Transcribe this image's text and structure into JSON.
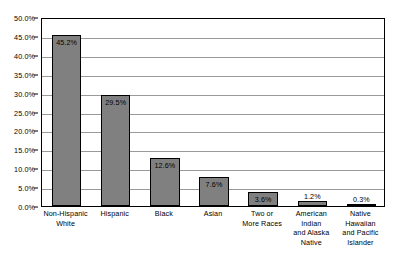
{
  "chart_data": {
    "type": "bar",
    "title": "",
    "subtitle": "",
    "xlabel": "",
    "ylabel": "",
    "ylim": [
      0,
      50
    ],
    "grid": true,
    "legend": "none",
    "orientation": "vertical",
    "categories": [
      "Non-Hispanic White",
      "Hispanic",
      "Black",
      "Asian",
      "Two or More Races",
      "American Indian and Alaska Native",
      "Native Hawaiian and Pacific Islander"
    ],
    "category_lines": [
      [
        "Non-Hispanic",
        "White"
      ],
      [
        "Hispanic"
      ],
      [
        "Black"
      ],
      [
        "Asian"
      ],
      [
        "Two or",
        "More Races"
      ],
      [
        "American",
        "Indian",
        "and Alaska",
        "Native"
      ],
      [
        "Native",
        "Hawaiian",
        "and Pacific",
        "Islander"
      ]
    ],
    "values": [
      45.2,
      29.5,
      12.6,
      7.6,
      3.6,
      1.2,
      0.3
    ],
    "data_labels": [
      "45.2%",
      "29.5%",
      "12.6%",
      "7.6%",
      "3.6%",
      "1.2%",
      "0.3%"
    ],
    "label_placement": [
      "inside",
      "inside",
      "inside",
      "inside",
      "inside",
      "outside",
      "outside"
    ],
    "y_ticks": [
      0,
      5,
      10,
      15,
      20,
      25,
      30,
      35,
      40,
      45,
      50
    ],
    "y_tick_labels": [
      "0.0%",
      "5.0%",
      "10.0%",
      "15.0%",
      "20.0%",
      "25.0%",
      "30.0%",
      "35.0%",
      "40.0%",
      "45.0%",
      "50.0%"
    ],
    "colors": {
      "bar_fill": "#808080",
      "bar_border": "#000000",
      "gridline": "#9a9a9a",
      "axis": "#000000",
      "plot_background": "#ffffff",
      "text": "#000000"
    }
  }
}
